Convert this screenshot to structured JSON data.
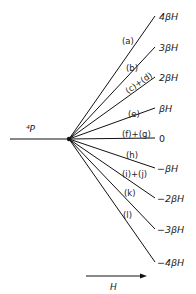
{
  "diagram": {
    "term_label": "⁴P",
    "field_label": "H",
    "origin": {
      "x": 69,
      "y": 139
    },
    "levels": [
      {
        "energy": "4βH",
        "line": "(a)",
        "y": 16
      },
      {
        "energy": "3βH",
        "line": "(b)",
        "y": 47
      },
      {
        "energy": "2βH",
        "line": "(c)+(d)",
        "y": 77
      },
      {
        "energy": "βH",
        "line": "(e)",
        "y": 108
      },
      {
        "energy": "0",
        "line": "(f)+(g)",
        "y": 138
      },
      {
        "energy": "−βH",
        "line": "(h)",
        "y": 168
      },
      {
        "energy": "−2βH",
        "line": "(i)+(j)",
        "y": 198
      },
      {
        "energy": "−3βH",
        "line": "(k)",
        "y": 229
      },
      {
        "energy": "−4βH",
        "line": "(l)",
        "y": 262
      }
    ]
  }
}
